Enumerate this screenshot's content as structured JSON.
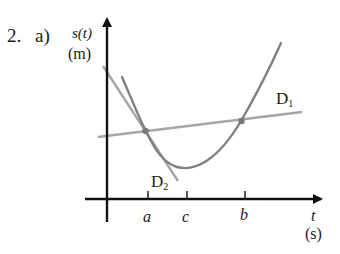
{
  "exercise": {
    "number": "2.",
    "part": "a)"
  },
  "axes": {
    "y_label": "s(t)",
    "y_unit": "(m)",
    "x_label": "t",
    "x_unit": "(s)"
  },
  "ticks": [
    {
      "label": "a"
    },
    {
      "label": "c"
    },
    {
      "label": "b"
    }
  ],
  "lines": {
    "secant": {
      "label": "D",
      "sub": "1"
    },
    "tangent": {
      "label": "D",
      "sub": "2"
    }
  },
  "colors": {
    "axis": "#111111",
    "curve": "#808080",
    "secant": "#a6a6a6",
    "tangent": "#a6a6a6",
    "point": "#7a7a7a"
  }
}
